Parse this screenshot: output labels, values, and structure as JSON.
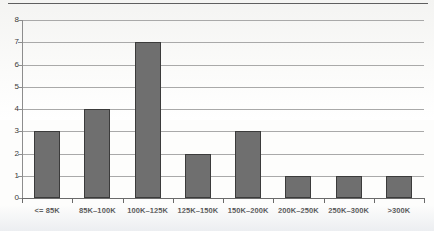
{
  "chart_data": {
    "type": "bar",
    "title": "",
    "subtitle": "",
    "xlabel": "",
    "ylabel": "",
    "categories": [
      "<= 85K",
      "85K–100K",
      "100K–125K",
      "125K–150K",
      "150K–200K",
      "200K–250K",
      "250K–300K",
      ">300K"
    ],
    "values": [
      3,
      4,
      7,
      2,
      3,
      1,
      1,
      1
    ],
    "ylim": [
      0,
      8
    ],
    "yticks": [
      0,
      1,
      2,
      3,
      4,
      5,
      6,
      7,
      8
    ],
    "ytick_labels": [
      "0",
      "1",
      "2",
      "3",
      "4",
      "5",
      "6",
      "7",
      "8"
    ],
    "grid": true,
    "legend": false,
    "legend_position": "none",
    "bar_color": "#6f6f6f",
    "bar_border_color": "#3b3b3b",
    "gridline_color": "#a9a9a9",
    "axis_color": "#6a6a6a",
    "background_color": "#fdfdfc"
  }
}
